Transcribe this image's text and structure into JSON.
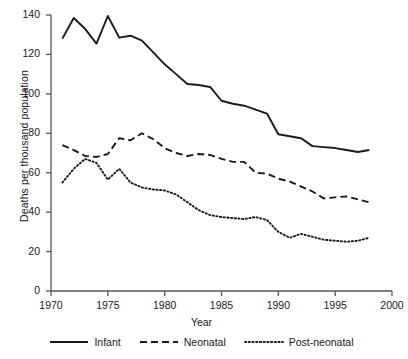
{
  "chart_data": {
    "type": "line",
    "title": "",
    "xlabel": "Year",
    "ylabel": "Deaths per thousand population",
    "xlim": [
      1970,
      2000
    ],
    "ylim": [
      0,
      140
    ],
    "xticks": [
      1970,
      1975,
      1980,
      1985,
      1990,
      1995,
      2000
    ],
    "yticks": [
      0,
      20,
      40,
      60,
      80,
      100,
      120,
      140
    ],
    "grid": false,
    "legend_position": "bottom",
    "x": [
      1971,
      1972,
      1973,
      1974,
      1975,
      1976,
      1977,
      1978,
      1979,
      1980,
      1981,
      1982,
      1983,
      1984,
      1985,
      1986,
      1987,
      1988,
      1989,
      1990,
      1991,
      1992,
      1993,
      1994,
      1995,
      1996,
      1997,
      1998
    ],
    "series": [
      {
        "name": "Infant",
        "style": "solid",
        "color": "#1a1a1a",
        "values": [
          128,
          138.5,
          133,
          125.5,
          139.5,
          128.5,
          129.5,
          127,
          121,
          115,
          110,
          105,
          104.5,
          103.5,
          96.5,
          95,
          94,
          92,
          90,
          79.5,
          78.5,
          77.5,
          73.5,
          73,
          72.5,
          71.5,
          70.5,
          71.5
        ]
      },
      {
        "name": "Neonatal",
        "style": "dashed",
        "color": "#1a1a1a",
        "values": [
          74,
          71.5,
          68.5,
          68,
          69.5,
          77.5,
          76.5,
          80,
          77,
          72.5,
          70,
          68.5,
          69.5,
          69,
          67,
          65.5,
          65.5,
          60,
          59.5,
          57,
          55.5,
          53,
          50.5,
          47,
          47.5,
          48,
          46.5,
          45
        ]
      },
      {
        "name": "Post-neonatal",
        "style": "dotted",
        "color": "#1a1a1a",
        "values": [
          55,
          62,
          67,
          65,
          56.5,
          62,
          55,
          52.5,
          51.5,
          51,
          49,
          45,
          41,
          38.5,
          37.5,
          37,
          36.5,
          37.5,
          36,
          30,
          27,
          29,
          27.5,
          26,
          25.5,
          25,
          25.5,
          27
        ]
      }
    ]
  },
  "legend": {
    "items": [
      {
        "label": "Infant",
        "style": "solid"
      },
      {
        "label": "Neonatal",
        "style": "dashed"
      },
      {
        "label": "Post-neonatal",
        "style": "dotted"
      }
    ]
  },
  "axis": {
    "x_tick_labels": [
      "1970",
      "1975",
      "1980",
      "1985",
      "1990",
      "1995",
      "2000"
    ],
    "y_tick_labels": [
      "0",
      "20",
      "40",
      "60",
      "80",
      "100",
      "120",
      "140"
    ]
  },
  "colors": {
    "ink": "#1a1a1a",
    "axis": "#555555",
    "background": "#ffffff"
  }
}
